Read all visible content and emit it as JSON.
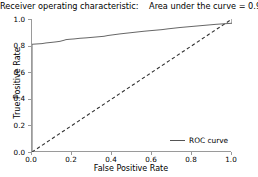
{
  "chart_data": {
    "type": "line",
    "title": "Receiver operating characteristic:    Area under the curve = 0.92",
    "xlabel": "False Positive Rate",
    "ylabel": "True Positive Rate",
    "xlim": [
      0.0,
      1.0
    ],
    "ylim": [
      0.0,
      1.0
    ],
    "grid": false,
    "legend_position": "lower right",
    "xticks": [
      "0.0",
      "0.2",
      "0.4",
      "0.6",
      "0.8",
      "1.0"
    ],
    "xtick_values": [
      0.0,
      0.2,
      0.4,
      0.6,
      0.8,
      1.0
    ],
    "yticks": [
      "0.0",
      "0.2",
      "0.4",
      "0.6",
      "0.8",
      "1.0"
    ],
    "ytick_values": [
      0.0,
      0.2,
      0.4,
      0.6,
      0.8,
      1.0
    ],
    "auc": 0.92,
    "series": [
      {
        "name": "ROC curve",
        "color": "#555555",
        "linestyle": "solid",
        "x": [
          0.0,
          0.0,
          0.02,
          0.05,
          0.07,
          0.09,
          0.12,
          0.14,
          0.16,
          0.17,
          0.19,
          0.21,
          0.24,
          0.27,
          0.3,
          0.33,
          0.36,
          0.38,
          0.41,
          0.44,
          0.47,
          0.5,
          0.53,
          0.56,
          0.59,
          0.62,
          0.65,
          0.68,
          0.71,
          0.74,
          0.77,
          0.8,
          0.83,
          0.86,
          0.89,
          0.92,
          0.95,
          0.98,
          1.0,
          1.0
        ],
        "y": [
          0.0,
          0.81,
          0.812,
          0.815,
          0.82,
          0.823,
          0.828,
          0.832,
          0.84,
          0.845,
          0.848,
          0.85,
          0.855,
          0.858,
          0.862,
          0.866,
          0.87,
          0.876,
          0.882,
          0.888,
          0.893,
          0.898,
          0.903,
          0.908,
          0.912,
          0.916,
          0.92,
          0.926,
          0.931,
          0.936,
          0.94,
          0.944,
          0.948,
          0.952,
          0.956,
          0.96,
          0.963,
          0.966,
          0.968,
          1.0
        ]
      },
      {
        "name": "chance-diagonal",
        "color": "#333333",
        "linestyle": "dashed",
        "x": [
          0.0,
          1.0
        ],
        "y": [
          0.0,
          1.0
        ]
      }
    ]
  },
  "legend": {
    "entries": [
      {
        "label": "ROC curve",
        "color": "#555555"
      }
    ]
  },
  "axes": {
    "spine_color": "#9a9a9a",
    "tick_color": "#9a9a9a"
  }
}
